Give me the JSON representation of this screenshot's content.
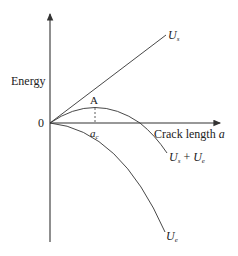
{
  "diagram": {
    "type": "energy-vs-crack-length",
    "y_axis_label": "Energy",
    "x_axis_label": "Crack length",
    "x_axis_symbol": "a",
    "origin_label": "0",
    "peak_label": "A",
    "critical_label_base": "a",
    "critical_label_sub": "c",
    "curves": [
      {
        "name": "surface-energy",
        "label_base": "U",
        "label_sub": "s",
        "shape": "linear increasing"
      },
      {
        "name": "total-energy",
        "label_base": "U",
        "label_sub": "s",
        "label_plus": "+",
        "label_base2": "U",
        "label_sub2": "e",
        "shape": "rises to max at A then falls"
      },
      {
        "name": "elastic-energy",
        "label_base": "U",
        "label_sub": "e",
        "shape": "parabolic decreasing"
      }
    ]
  }
}
